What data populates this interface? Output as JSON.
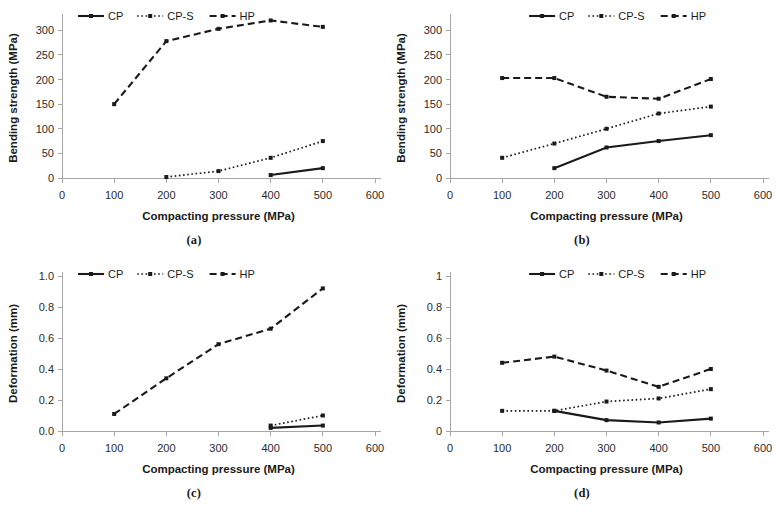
{
  "figure": {
    "panels": [
      {
        "id": "a",
        "caption": "(a)",
        "legend": [
          "CP",
          "CP-S",
          "HP"
        ]
      },
      {
        "id": "b",
        "caption": "(b)",
        "legend": [
          "CP",
          "CP-S",
          "HP"
        ]
      },
      {
        "id": "c",
        "caption": "(c)",
        "legend": [
          "CP",
          "CP-S",
          "HP"
        ]
      },
      {
        "id": "d",
        "caption": "(d)",
        "legend": [
          "CP",
          "CP-S",
          "HP"
        ]
      }
    ],
    "line_styles": {
      "CP": "solid",
      "CP-S": "dotted",
      "HP": "dashed"
    },
    "colors": {
      "line": "#1a1a1a",
      "axis": "#a6a6a6",
      "text": "#1a1a1a",
      "background": "#ffffff"
    }
  },
  "chart_data": [
    {
      "type": "line",
      "panel": "a",
      "title": "",
      "xlabel": "Compacting pressure (MPa)",
      "ylabel": "Bending strength (MPa)",
      "xlim": [
        0,
        600
      ],
      "ylim": [
        0,
        325
      ],
      "xticks": [
        0,
        100,
        200,
        300,
        400,
        500,
        600
      ],
      "xticklabels": [
        "0",
        "100",
        "200",
        "300",
        "400",
        "500",
        "600"
      ],
      "yticks": [
        0,
        50,
        100,
        150,
        200,
        250,
        300
      ],
      "yticklabels": [
        "0",
        "50",
        "100",
        "150",
        "200",
        "250",
        "300"
      ],
      "grid": false,
      "legend": [
        "CP",
        "CP-S",
        "HP"
      ],
      "legend_position": "top-left",
      "series": [
        {
          "name": "CP",
          "x": [
            400,
            500
          ],
          "values": [
            6,
            20
          ]
        },
        {
          "name": "CP-S",
          "x": [
            200,
            300,
            400,
            500
          ],
          "values": [
            2,
            14,
            41,
            75
          ]
        },
        {
          "name": "HP",
          "x": [
            100,
            200,
            300,
            400,
            500
          ],
          "values": [
            150,
            278,
            303,
            320,
            307
          ]
        }
      ]
    },
    {
      "type": "line",
      "panel": "b",
      "title": "",
      "xlabel": "Compacting pressure (MPa)",
      "ylabel": "Bending strength (MPa)",
      "xlim": [
        0,
        600
      ],
      "ylim": [
        0,
        325
      ],
      "xticks": [
        0,
        100,
        200,
        300,
        400,
        500,
        600
      ],
      "xticklabels": [
        "0",
        "100",
        "200",
        "300",
        "400",
        "500",
        "600"
      ],
      "yticks": [
        0,
        50,
        100,
        150,
        200,
        250,
        300
      ],
      "yticklabels": [
        "0",
        "50",
        "100",
        "150",
        "200",
        "250",
        "300"
      ],
      "grid": false,
      "legend": [
        "CP",
        "CP-S",
        "HP"
      ],
      "legend_position": "top-center",
      "series": [
        {
          "name": "CP",
          "x": [
            200,
            300,
            400,
            500
          ],
          "values": [
            20,
            62,
            75,
            87
          ]
        },
        {
          "name": "CP-S",
          "x": [
            100,
            200,
            300,
            400,
            500
          ],
          "values": [
            41,
            70,
            100,
            131,
            145
          ]
        },
        {
          "name": "HP",
          "x": [
            100,
            200,
            300,
            400,
            500
          ],
          "values": [
            203,
            203,
            165,
            161,
            201
          ]
        }
      ]
    },
    {
      "type": "line",
      "panel": "c",
      "title": "",
      "xlabel": "Compacting pressure (MPa)",
      "ylabel": "Deformation (mm)",
      "xlim": [
        0,
        600
      ],
      "ylim": [
        0,
        1.0
      ],
      "xticks": [
        0,
        100,
        200,
        300,
        400,
        500,
        600
      ],
      "xticklabels": [
        "0",
        "100",
        "200",
        "300",
        "400",
        "500",
        "600"
      ],
      "yticks": [
        0.0,
        0.2,
        0.4,
        0.6,
        0.8,
        1.0
      ],
      "yticklabels": [
        "0.0",
        "0.2",
        "0.4",
        "0.6",
        "0.8",
        "1.0"
      ],
      "grid": false,
      "legend": [
        "CP",
        "CP-S",
        "HP"
      ],
      "legend_position": "top-left",
      "series": [
        {
          "name": "CP",
          "x": [
            400,
            500
          ],
          "values": [
            0.02,
            0.035
          ]
        },
        {
          "name": "CP-S",
          "x": [
            400,
            500
          ],
          "values": [
            0.035,
            0.1
          ]
        },
        {
          "name": "HP",
          "x": [
            100,
            200,
            300,
            400,
            500
          ],
          "values": [
            0.11,
            0.34,
            0.56,
            0.66,
            0.92
          ]
        }
      ]
    },
    {
      "type": "line",
      "panel": "d",
      "title": "",
      "xlabel": "Compacting pressure (MPa)",
      "ylabel": "Deformation (mm)",
      "xlim": [
        0,
        600
      ],
      "ylim": [
        0,
        1
      ],
      "xticks": [
        0,
        100,
        200,
        300,
        400,
        500,
        600
      ],
      "xticklabels": [
        "0",
        "100",
        "200",
        "300",
        "400",
        "500",
        "600"
      ],
      "yticks": [
        0,
        0.2,
        0.4,
        0.6,
        0.8,
        1
      ],
      "yticklabels": [
        "0",
        "0.2",
        "0.4",
        "0.6",
        "0.8",
        "1"
      ],
      "grid": false,
      "legend": [
        "CP",
        "CP-S",
        "HP"
      ],
      "legend_position": "top-center",
      "series": [
        {
          "name": "CP",
          "x": [
            200,
            300,
            400,
            500
          ],
          "values": [
            0.13,
            0.07,
            0.055,
            0.08
          ]
        },
        {
          "name": "CP-S",
          "x": [
            100,
            200,
            300,
            400,
            500
          ],
          "values": [
            0.13,
            0.13,
            0.19,
            0.21,
            0.27
          ]
        },
        {
          "name": "HP",
          "x": [
            100,
            200,
            300,
            400,
            500
          ],
          "values": [
            0.44,
            0.48,
            0.39,
            0.285,
            0.4
          ]
        }
      ]
    }
  ]
}
